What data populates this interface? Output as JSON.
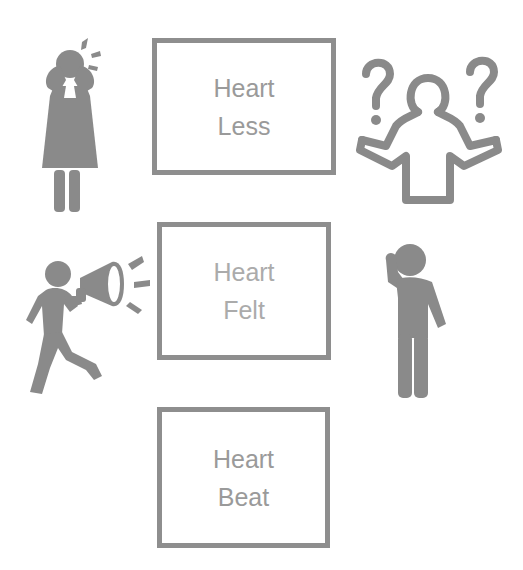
{
  "diagram": {
    "boxes": [
      {
        "line1": "Heart",
        "line2": "Less"
      },
      {
        "line1": "Heart",
        "line2": "Felt"
      },
      {
        "line1": "Heart",
        "line2": "Beat"
      }
    ],
    "icons": [
      {
        "name": "crying-woman-icon",
        "position": "top-left"
      },
      {
        "name": "confused-person-question-marks-icon",
        "position": "top-right"
      },
      {
        "name": "person-megaphone-icon",
        "position": "middle-left"
      },
      {
        "name": "thinking-person-icon",
        "position": "middle-right"
      }
    ],
    "colors": {
      "border": "#8e8e8e",
      "text": "#9a9a9a",
      "icon_fill": "#8a8a8a"
    }
  }
}
